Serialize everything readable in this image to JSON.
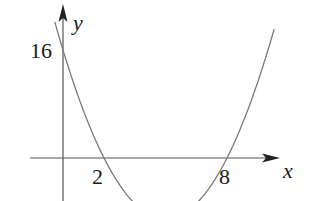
{
  "chart_data": {
    "type": "line",
    "title": "",
    "function": "y = x^2 - 10x + 16",
    "xlabel": "x",
    "ylabel": "y",
    "annotations": [
      {
        "text": "16",
        "meaning": "y-intercept",
        "x": 0,
        "y": 16
      },
      {
        "text": "2",
        "meaning": "x-intercept",
        "x": 2,
        "y": 0
      },
      {
        "text": "8",
        "meaning": "x-intercept",
        "x": 8,
        "y": 0
      }
    ],
    "series": [
      {
        "name": "parabola",
        "x": [
          -0.4,
          0,
          1,
          2,
          3,
          4,
          5,
          6,
          7,
          8,
          9,
          10.3
        ],
        "values": [
          20.16,
          16,
          7,
          0,
          -5,
          -8,
          -9,
          -8,
          -5,
          0,
          7,
          19.99
        ]
      }
    ],
    "xlim": [
      -1.6,
      11
    ],
    "ylim": [
      -6.4,
      22.7
    ],
    "grid": false,
    "legend": "none"
  },
  "labels": {
    "y_axis": "y",
    "x_axis": "x",
    "y_intercept": "16",
    "root_left": "2",
    "root_right": "8"
  },
  "colors": {
    "axis": "#555555",
    "curve": "#7a7a7a",
    "text": "#1a1a1a",
    "background": "#ffffff"
  }
}
